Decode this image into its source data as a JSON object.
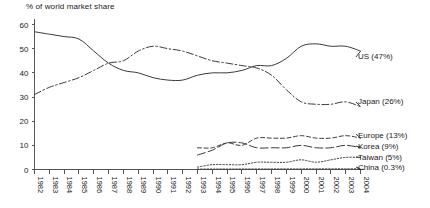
{
  "chart_data": {
    "type": "line",
    "title": "% of world market share",
    "xlabel": "",
    "ylabel": "",
    "ylim": [
      0,
      60
    ],
    "yticks": [
      0,
      10,
      20,
      30,
      40,
      50,
      60
    ],
    "grid": false,
    "legend_position": "right-inline",
    "categories": [
      "1982",
      "1983",
      "1984",
      "1985",
      "1986",
      "1987",
      "1988",
      "1989",
      "1990",
      "1991",
      "1992",
      "1993",
      "1994",
      "1995",
      "1996",
      "1997",
      "1998",
      "1999",
      "2000",
      "2001",
      "2002",
      "2003",
      "2004"
    ],
    "series": [
      {
        "name": "US",
        "label": "US (47%)",
        "style": "solid",
        "x": [
          "1982",
          "1983",
          "1984",
          "1985",
          "1986",
          "1987",
          "1988",
          "1989",
          "1990",
          "1991",
          "1992",
          "1993",
          "1994",
          "1995",
          "1996",
          "1997",
          "1998",
          "1999",
          "2000",
          "2001",
          "2002",
          "2003",
          "2004"
        ],
        "values": [
          57,
          56,
          55,
          54,
          49,
          44,
          41,
          40,
          38,
          37,
          37,
          39,
          40,
          40,
          41,
          43,
          43,
          46,
          51,
          52,
          51,
          51,
          49
        ]
      },
      {
        "name": "Japan",
        "label": "Japan (26%)",
        "style": "dash-dot",
        "x": [
          "1982",
          "1983",
          "1984",
          "1985",
          "1986",
          "1987",
          "1988",
          "1989",
          "1990",
          "1991",
          "1992",
          "1993",
          "1994",
          "1995",
          "1996",
          "1997",
          "1998",
          "1999",
          "2000",
          "2001",
          "2002",
          "2003",
          "2004"
        ],
        "values": [
          31,
          34,
          36,
          38,
          41,
          44,
          45,
          49,
          51,
          50,
          49,
          47,
          45,
          44,
          43,
          42,
          39,
          33,
          28,
          27,
          27,
          28,
          26
        ]
      },
      {
        "name": "Europe",
        "label": "Europe (13%)",
        "style": "dashed-short",
        "x": [
          "1993",
          "1994",
          "1995",
          "1996",
          "1997",
          "1998",
          "1999",
          "2000",
          "2001",
          "2002",
          "2003",
          "2004"
        ],
        "values": [
          9,
          9,
          11,
          10,
          13,
          13,
          13,
          14,
          13,
          13,
          14,
          13
        ]
      },
      {
        "name": "Korea",
        "label": "Korea (9%)",
        "style": "dashed-long",
        "x": [
          "1993",
          "1994",
          "1995",
          "1996",
          "1997",
          "1998",
          "1999",
          "2000",
          "2001",
          "2002",
          "2003",
          "2004"
        ],
        "values": [
          6,
          8,
          11,
          11,
          9,
          9,
          9,
          10,
          9,
          9,
          10,
          9
        ]
      },
      {
        "name": "Taiwan",
        "label": "Taiwan (5%)",
        "style": "dotted",
        "x": [
          "1993",
          "1994",
          "1995",
          "1996",
          "1997",
          "1998",
          "1999",
          "2000",
          "2001",
          "2002",
          "2003",
          "2004"
        ],
        "values": [
          1,
          2,
          2,
          2,
          3,
          3,
          3,
          4,
          3,
          4,
          5,
          5
        ]
      },
      {
        "name": "China",
        "label": "China (0.3%)",
        "style": "dotted",
        "x": [
          "1993",
          "2004"
        ],
        "values": [
          0.2,
          0.3
        ]
      }
    ]
  },
  "legend": {
    "us": "US (47%)",
    "japan": "Japan (26%)",
    "europe": "Europe (13%)",
    "korea": "Korea (9%)",
    "taiwan": "Taiwan (5%)",
    "china": "China (0.3%)"
  }
}
